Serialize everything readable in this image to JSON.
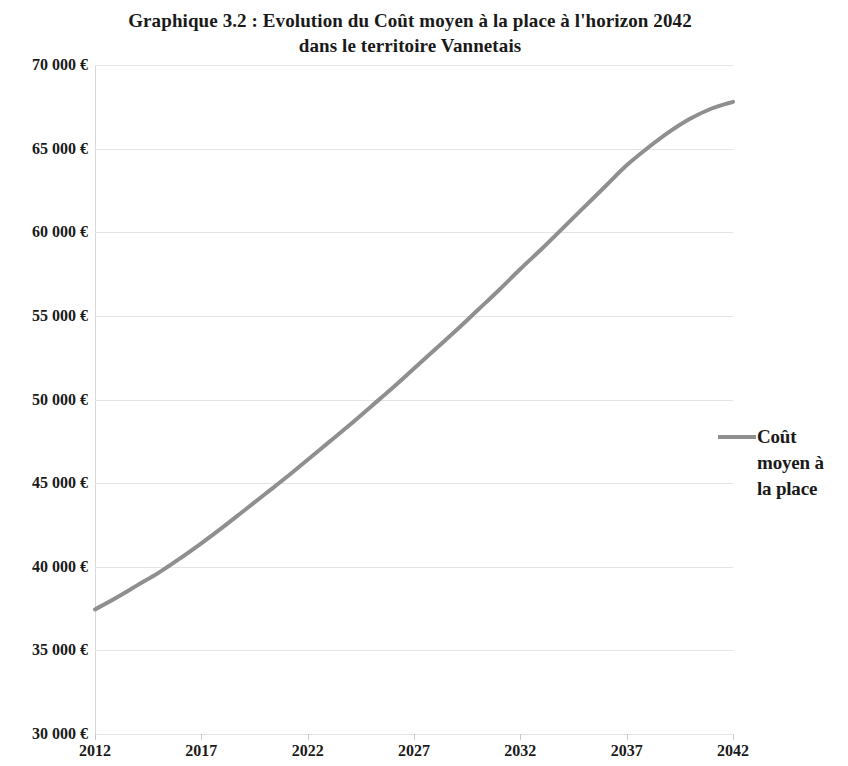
{
  "chart_data": {
    "type": "line",
    "title": "Graphique 3.2 : Evolution du Coût moyen à la place à l'horizon 2042 dans le territoire Vannetais",
    "title_lines": [
      "Graphique 3.2 : Evolution du Coût moyen à la place à l'horizon 2042",
      "dans le territoire Vannetais"
    ],
    "xlabel": "",
    "ylabel": "",
    "xlim": [
      2012,
      2042
    ],
    "ylim": [
      30000,
      70000
    ],
    "grid": true,
    "legend_position": "right",
    "x_tick_labels": [
      "2012",
      "2017",
      "2022",
      "2027",
      "2032",
      "2037",
      "2042"
    ],
    "x_ticks": [
      2012,
      2017,
      2022,
      2027,
      2032,
      2037,
      2042
    ],
    "y_tick_labels": [
      "70 000 €",
      "65 000 €",
      "60 000 €",
      "55 000 €",
      "50 000 €",
      "45 000 €",
      "40 000 €",
      "35 000 €",
      "30 000 €"
    ],
    "y_ticks": [
      70000,
      65000,
      60000,
      55000,
      50000,
      45000,
      40000,
      35000,
      30000
    ],
    "series": [
      {
        "name": "Coût moyen à la place",
        "name_lines": [
          "Coût",
          "moyen à",
          "la place"
        ],
        "color": "#8f8f8f",
        "line_width": 4,
        "x": [
          2012,
          2013,
          2014,
          2015,
          2016,
          2017,
          2018,
          2019,
          2020,
          2021,
          2022,
          2023,
          2024,
          2025,
          2026,
          2027,
          2028,
          2029,
          2030,
          2031,
          2032,
          2033,
          2034,
          2035,
          2036,
          2037,
          2038,
          2039,
          2040,
          2041,
          2042
        ],
        "values": [
          37450,
          38150,
          38900,
          39650,
          40500,
          41400,
          42350,
          43350,
          44350,
          45350,
          46400,
          47450,
          48500,
          49600,
          50700,
          51850,
          53000,
          54150,
          55350,
          56550,
          57800,
          59000,
          60250,
          61500,
          62750,
          64000,
          65050,
          66000,
          66800,
          67400,
          67800
        ]
      }
    ]
  }
}
